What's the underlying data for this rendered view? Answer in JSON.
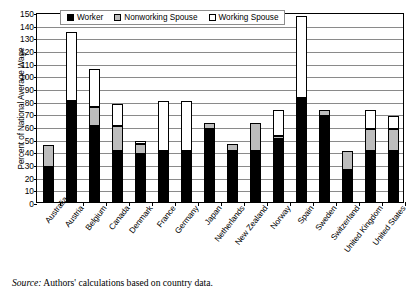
{
  "figure": {
    "source_prefix": "Source:",
    "source_text": " Authors' calculations based on country data."
  },
  "legend": {
    "position": "top-inside",
    "items": [
      {
        "label": "Worker",
        "color": "#000000",
        "icon": "filled-square-swatch"
      },
      {
        "label": "Nonworking Spouse",
        "color": "#bdbdbd",
        "icon": "gray-square-swatch"
      },
      {
        "label": "Working Spouse",
        "color": "#ffffff",
        "icon": "empty-square-swatch"
      }
    ]
  },
  "chart_data": {
    "type": "bar",
    "stacked": true,
    "title": "",
    "xlabel": "",
    "ylabel": "Percent of National Average Wage",
    "ylim": [
      0,
      150
    ],
    "ytick_step": 10,
    "yticks": [
      0,
      10,
      20,
      30,
      40,
      50,
      60,
      70,
      80,
      90,
      100,
      110,
      120,
      130,
      140,
      150
    ],
    "grid": true,
    "grid_axis": "y",
    "categories": [
      "Australia",
      "Austria",
      "Belgium",
      "Canada",
      "Denmark",
      "France",
      "Germany",
      "Japan",
      "Netherlands",
      "New Zealand",
      "Norway",
      "Spain",
      "Sweden",
      "Switzerland",
      "United Kingdom",
      "United States"
    ],
    "series": [
      {
        "name": "Worker",
        "color": "#000000",
        "values": [
          28,
          80,
          60,
          40,
          38,
          40,
          40,
          58,
          40,
          40,
          50,
          82,
          68,
          25,
          40,
          40
        ]
      },
      {
        "name": "Nonworking Spouse",
        "color": "#bdbdbd",
        "values": [
          17,
          0,
          15,
          20,
          8,
          0,
          0,
          4,
          6,
          22,
          2,
          0,
          5,
          15,
          18,
          18
        ]
      },
      {
        "name": "Working Spouse",
        "color": "#ffffff",
        "values": [
          0,
          54,
          30,
          17,
          2,
          40,
          40,
          0,
          0,
          0,
          21,
          65,
          0,
          0,
          15,
          10
        ]
      }
    ],
    "totals": [
      45,
      134,
      105,
      77,
      48,
      80,
      80,
      62,
      46,
      62,
      73,
      147,
      73,
      40,
      73,
      68
    ]
  }
}
